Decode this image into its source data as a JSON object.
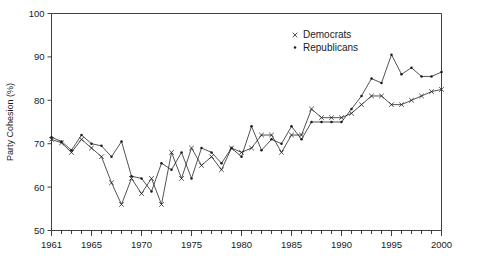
{
  "chart_data": {
    "type": "line",
    "title": "",
    "xlabel": "",
    "ylabel": "Party Cohesion (%)",
    "xlim": [
      1961,
      2000
    ],
    "ylim": [
      50,
      100
    ],
    "ytick_labels": [
      "50",
      "60",
      "70",
      "80",
      "90",
      "100"
    ],
    "ytick_values": [
      50,
      60,
      70,
      80,
      90,
      100
    ],
    "xtick_labels": [
      "1961",
      "1965",
      "1970",
      "1975",
      "1980",
      "1985",
      "1990",
      "1995",
      "2000"
    ],
    "xtick_values": [
      1961,
      1965,
      1970,
      1975,
      1980,
      1985,
      1990,
      1995,
      2000
    ],
    "minor_xticks_every": 1,
    "grid": false,
    "legend_position": "top-right",
    "x": [
      1961,
      1962,
      1963,
      1964,
      1965,
      1966,
      1967,
      1968,
      1969,
      1970,
      1971,
      1972,
      1973,
      1974,
      1975,
      1976,
      1977,
      1978,
      1979,
      1980,
      1981,
      1982,
      1983,
      1984,
      1985,
      1986,
      1987,
      1988,
      1989,
      1990,
      1991,
      1992,
      1993,
      1994,
      1995,
      1996,
      1997,
      1998,
      1999,
      2000
    ],
    "series": [
      {
        "name": "Democrats",
        "marker": "x",
        "values": [
          71.0,
          70.2,
          68.0,
          71.0,
          69.0,
          67.0,
          61.0,
          56.0,
          62.0,
          58.5,
          62.0,
          56.0,
          68.0,
          62.0,
          69.0,
          65.0,
          67.0,
          64.0,
          69.0,
          68.0,
          69.0,
          72.0,
          72.0,
          68.0,
          72.0,
          72.0,
          78.0,
          76.0,
          76.0,
          76.0,
          77.0,
          79.0,
          81.0,
          81.0,
          79.0,
          79.0,
          80.0,
          81.0,
          82.0,
          82.5
        ]
      },
      {
        "name": "Republicans",
        "marker": "dot",
        "values": [
          71.5,
          70.5,
          68.5,
          72.0,
          70.0,
          69.5,
          67.0,
          70.5,
          62.5,
          62.0,
          59.0,
          65.5,
          64.0,
          68.0,
          62.0,
          69.0,
          68.0,
          65.5,
          69.0,
          67.0,
          74.0,
          68.5,
          71.0,
          70.0,
          74.0,
          71.0,
          75.0,
          75.0,
          75.0,
          75.0,
          78.0,
          81.0,
          85.0,
          84.0,
          90.5,
          86.0,
          87.5,
          85.5,
          85.5,
          86.5
        ]
      }
    ]
  },
  "legend": {
    "items": [
      {
        "label": "Democrats",
        "marker": "x"
      },
      {
        "label": "Republicans",
        "marker": "dot"
      }
    ]
  },
  "colors": {
    "line": "#1a1a1a",
    "axis": "#2b2b2b",
    "background": "#ffffff"
  }
}
